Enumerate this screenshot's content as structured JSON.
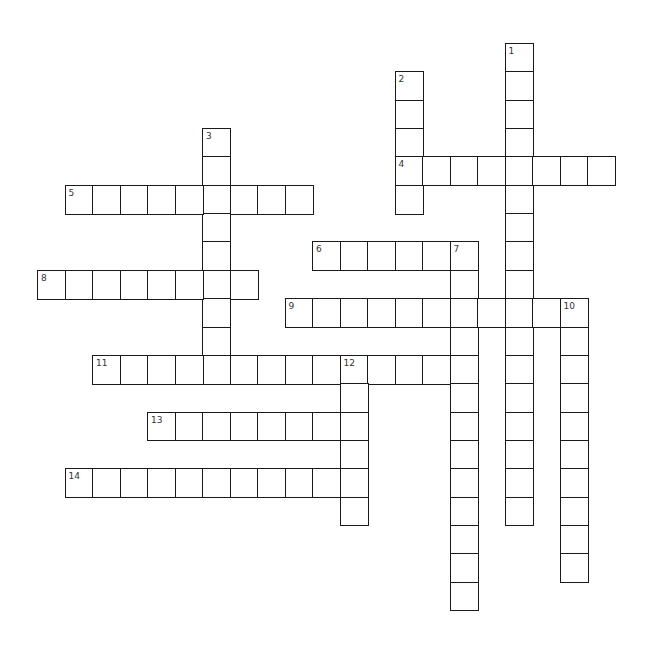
{
  "puzzle": {
    "type": "crossword",
    "grid": {
      "origin_x": 37,
      "origin_y": 43,
      "cell_width": 27.5,
      "cell_height": 28.35,
      "border_color": "#1a1a1a",
      "number_color": "#333333",
      "background": "#ffffff"
    },
    "words": [
      {
        "number": 1,
        "direction": "down",
        "row": 0,
        "col": 17,
        "length": 17
      },
      {
        "number": 2,
        "direction": "down",
        "row": 1,
        "col": 13,
        "length": 5
      },
      {
        "number": 3,
        "direction": "down",
        "row": 3,
        "col": 6,
        "length": 9
      },
      {
        "number": 4,
        "direction": "across",
        "row": 4,
        "col": 13,
        "length": 8
      },
      {
        "number": 5,
        "direction": "across",
        "row": 5,
        "col": 1,
        "length": 9
      },
      {
        "number": 6,
        "direction": "across",
        "row": 7,
        "col": 10,
        "length": 6
      },
      {
        "number": 7,
        "direction": "down",
        "row": 7,
        "col": 15,
        "length": 13
      },
      {
        "number": 8,
        "direction": "across",
        "row": 8,
        "col": 0,
        "length": 8
      },
      {
        "number": 9,
        "direction": "across",
        "row": 9,
        "col": 9,
        "length": 11
      },
      {
        "number": 10,
        "direction": "down",
        "row": 9,
        "col": 19,
        "length": 10
      },
      {
        "number": 11,
        "direction": "across",
        "row": 11,
        "col": 2,
        "length": 14
      },
      {
        "number": 12,
        "direction": "down",
        "row": 11,
        "col": 11,
        "length": 6
      },
      {
        "number": 13,
        "direction": "across",
        "row": 13,
        "col": 4,
        "length": 8
      },
      {
        "number": 14,
        "direction": "across",
        "row": 15,
        "col": 1,
        "length": 11
      }
    ]
  }
}
